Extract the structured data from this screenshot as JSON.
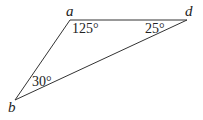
{
  "diagram": {
    "type": "triangle",
    "vertices": [
      {
        "id": "a",
        "label": "a",
        "x": 70,
        "y": 20
      },
      {
        "id": "d",
        "label": "d",
        "x": 187,
        "y": 20
      },
      {
        "id": "b",
        "label": "b",
        "x": 15,
        "y": 100
      }
    ],
    "edges": [
      [
        "a",
        "d"
      ],
      [
        "d",
        "b"
      ],
      [
        "b",
        "a"
      ]
    ],
    "angles": [
      {
        "vertex": "a",
        "label": "125°"
      },
      {
        "vertex": "d",
        "label": "25°"
      },
      {
        "vertex": "b",
        "label": "30°"
      }
    ],
    "stroke_color": "#333333"
  }
}
